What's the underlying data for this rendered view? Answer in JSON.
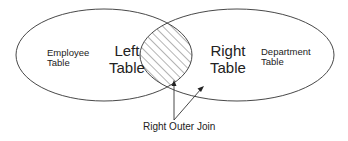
{
  "diagram": {
    "left_circle": {
      "name_line1": "Employee",
      "name_line2": "Table",
      "role_line1": "Left",
      "role_line2": "Table"
    },
    "right_circle": {
      "role_line1": "Right",
      "role_line2": "Table",
      "name_line1": "Department",
      "name_line2": "Table"
    },
    "intersection": {
      "fill": "hatched"
    },
    "caption": "Right Outer Join",
    "colors": {
      "stroke": "#333333",
      "text": "#222222",
      "background": "#ffffff"
    }
  }
}
